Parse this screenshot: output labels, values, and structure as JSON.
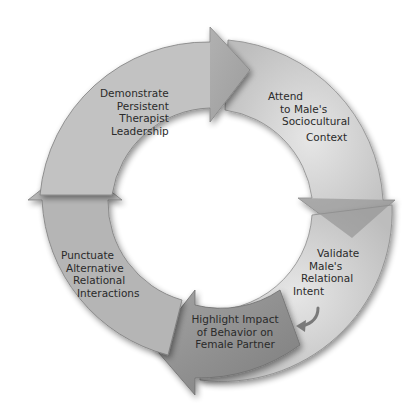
{
  "diagram": {
    "type": "cycle",
    "direction": "clockwise",
    "colors": {
      "segment_light": "#d4d4d4",
      "segment_mid": "#b8b8b8",
      "segment_dark": "#8e8e8e",
      "outline": "#7a7a7a",
      "text": "#2a2a2a",
      "background": "#ffffff"
    },
    "steps": [
      {
        "id": "demonstrate",
        "lines": [
          "Demonstrate",
          "Persistent",
          "Therapist",
          "Leadership"
        ]
      },
      {
        "id": "attend",
        "lines": [
          "Attend",
          "to Male's",
          "Sociocultural",
          "Context"
        ]
      },
      {
        "id": "validate",
        "lines": [
          "Validate",
          "Male's",
          "Relational",
          "Intent"
        ]
      },
      {
        "id": "highlight",
        "lines": [
          "Highlight Impact",
          "of Behavior on",
          "Female Partner"
        ]
      },
      {
        "id": "punctuate",
        "lines": [
          "Punctuate",
          "Alternative",
          "Relational",
          "Interactions"
        ]
      }
    ],
    "small_arrow": "curved-arrow-icon"
  }
}
